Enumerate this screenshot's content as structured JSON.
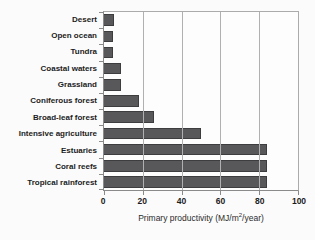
{
  "figure": {
    "background_color": "#fbfbfb",
    "text_color": "#1c1c1c"
  },
  "chart_data": {
    "type": "bar",
    "orientation": "horizontal",
    "title": "",
    "categories": [
      "Desert",
      "Open ocean",
      "Tundra",
      "Coastal waters",
      "Grassland",
      "Coniferous forest",
      "Broad-leaf forest",
      "Intensive agriculture",
      "Estuaries",
      "Coral reefs",
      "Tropical rainforest"
    ],
    "values": [
      5,
      4.5,
      4.5,
      9,
      9,
      18,
      26,
      50,
      84,
      84,
      84
    ],
    "xlabel": "Primary productivity (MJ/m2/year)",
    "xlabel_parts": {
      "prefix": "Primary productivity (MJ/m",
      "sup": "2",
      "suffix": "/year)"
    },
    "ylabel": "",
    "xlim": [
      0,
      100
    ],
    "xticks": [
      0,
      20,
      40,
      60,
      80,
      100
    ],
    "grid": true,
    "legend": false,
    "bar_color": "#58585a",
    "bar_border_color": "#3d3d3f",
    "gridline_color": "#b0b0b0",
    "axis_color": "#8a8a8a"
  }
}
